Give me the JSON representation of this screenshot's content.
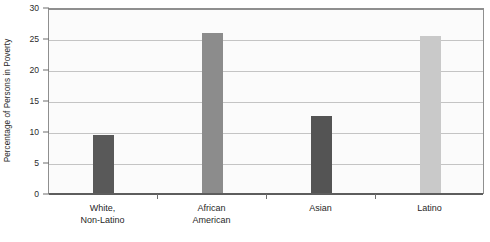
{
  "chart_data": {
    "type": "bar",
    "title": "",
    "subtitle": "",
    "xlabel": "",
    "ylabel": "Percentage of Persons in Poverty",
    "categories": [
      "White, Non-Latino",
      "African American",
      "Asian",
      "Latino"
    ],
    "category_lines": [
      [
        "White,",
        "Non-Latino"
      ],
      [
        "African",
        "American"
      ],
      [
        "Asian",
        ""
      ],
      [
        "Latino",
        ""
      ]
    ],
    "values": [
      9.4,
      25.8,
      12.4,
      25.3
    ],
    "bar_colors": [
      "#595959",
      "#8c8c8c",
      "#545454",
      "#c9c9c9"
    ],
    "ylim": [
      0,
      30
    ],
    "yticks": [
      0,
      5,
      10,
      15,
      20,
      25,
      30
    ],
    "ytick_labels": [
      "0",
      "5",
      "10",
      "15",
      "20",
      "25",
      "30"
    ],
    "grid": true,
    "grid_axis": "y",
    "legend": false,
    "legend_position": "none",
    "plot_background": "#fbfbfb",
    "gridline_color": "#c4c4c4",
    "axis_color": "#8f8f8f"
  }
}
